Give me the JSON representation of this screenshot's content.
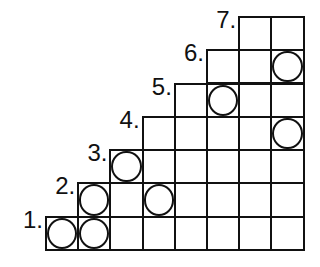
{
  "diagram": {
    "type": "staircase-grid",
    "columns": 8,
    "rows": [
      {
        "label": "1.",
        "row": 1,
        "start_col": 0,
        "cells": 8,
        "circles": [
          0,
          1
        ]
      },
      {
        "label": "2.",
        "row": 2,
        "start_col": 1,
        "cells": 7,
        "circles": [
          1,
          3
        ]
      },
      {
        "label": "3.",
        "row": 3,
        "start_col": 2,
        "cells": 6,
        "circles": [
          2
        ]
      },
      {
        "label": "4.",
        "row": 4,
        "start_col": 3,
        "cells": 5,
        "circles": [
          7
        ]
      },
      {
        "label": "5.",
        "row": 5,
        "start_col": 4,
        "cells": 4,
        "circles": [
          5
        ]
      },
      {
        "label": "6.",
        "row": 6,
        "start_col": 5,
        "cells": 3,
        "circles": [
          7
        ]
      },
      {
        "label": "7.",
        "row": 7,
        "start_col": 6,
        "cells": 2,
        "circles": []
      }
    ],
    "colors": {
      "line": "#111111",
      "background": "#ffffff"
    }
  }
}
